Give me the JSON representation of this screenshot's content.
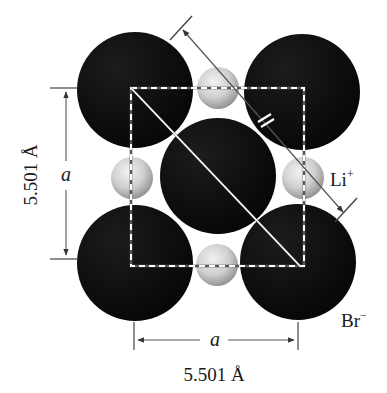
{
  "figure": {
    "labels": {
      "cation": "Li",
      "cation_charge": "+",
      "anion": "Br",
      "anion_charge": "−",
      "edge_symbol": "a",
      "edge_length_vertical": "5.501 Å",
      "edge_length_horizontal": "5.501 Å"
    },
    "colors": {
      "anion_fill": "#0d0d0d",
      "cation_fill_light": "#e6e6e6",
      "cation_fill_dark": "#9a9a9a",
      "dash_line": "#ffffff",
      "dimension_line": "#444444"
    },
    "anions": [
      {
        "id": "br-top-left",
        "cx": 135,
        "cy": 90,
        "r": 58
      },
      {
        "id": "br-top-right",
        "cx": 302,
        "cy": 92,
        "r": 58
      },
      {
        "id": "br-center",
        "cx": 218,
        "cy": 176,
        "r": 58
      },
      {
        "id": "br-bottom-left",
        "cx": 135,
        "cy": 263,
        "r": 58
      },
      {
        "id": "br-bottom-right",
        "cx": 298,
        "cy": 262,
        "r": 58
      }
    ],
    "cations": [
      {
        "id": "li-top",
        "cx": 218,
        "cy": 88,
        "r": 21
      },
      {
        "id": "li-left",
        "cx": 132,
        "cy": 178,
        "r": 21
      },
      {
        "id": "li-right",
        "cx": 303,
        "cy": 178,
        "r": 21
      },
      {
        "id": "li-bottom",
        "cx": 217,
        "cy": 265,
        "r": 21
      }
    ],
    "unit_square": {
      "x1": 131,
      "y1": 88,
      "x2": 304,
      "y2": 266
    }
  }
}
